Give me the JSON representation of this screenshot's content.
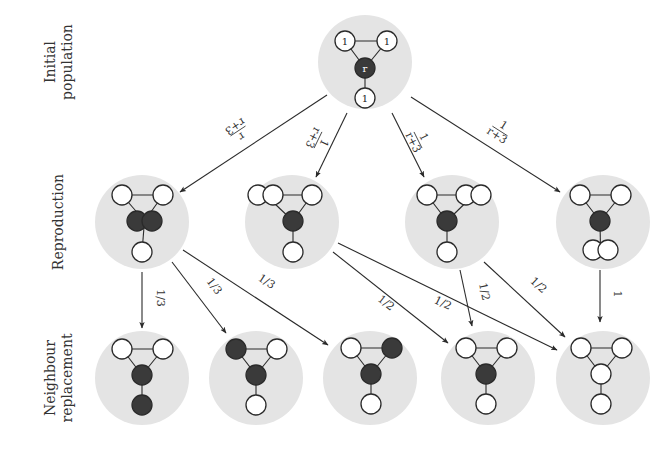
{
  "diagram": {
    "colors": {
      "halo": "#e4e4e4",
      "mutant": "#3a3a3a",
      "resident": "#ffffff",
      "stroke": "#2a2a2a",
      "text": "#333333"
    },
    "row_labels": [
      {
        "id": "initial",
        "lines": [
          "Initial",
          "population"
        ]
      },
      {
        "id": "reproduction",
        "lines": [
          "Reproduction"
        ]
      },
      {
        "id": "neighbour",
        "lines": [
          "Neighbour",
          "replacement"
        ]
      }
    ],
    "nodes": {
      "initial": {
        "x": 365,
        "y": 62,
        "circles": [
          {
            "x": 345,
            "y": 41,
            "type": "resident",
            "label": "1"
          },
          {
            "x": 387,
            "y": 41,
            "type": "resident",
            "label": "1"
          },
          {
            "x": 365,
            "y": 68,
            "type": "mutant",
            "label": "r"
          },
          {
            "x": 365,
            "y": 98,
            "type": "resident",
            "label": "1"
          }
        ]
      },
      "reproduction": [
        {
          "id": "R1",
          "x": 142,
          "y": 222,
          "circles": [
            {
              "x": 122,
              "y": 195,
              "type": "resident"
            },
            {
              "x": 163,
              "y": 195,
              "type": "resident"
            },
            {
              "x": 137,
              "y": 221,
              "type": "mutant"
            },
            {
              "x": 152,
              "y": 221,
              "type": "mutant"
            },
            {
              "x": 142,
              "y": 252,
              "type": "resident"
            }
          ]
        },
        {
          "id": "R2",
          "x": 292,
          "y": 222,
          "circles": [
            {
              "x": 258,
              "y": 195,
              "type": "resident"
            },
            {
              "x": 273,
              "y": 195,
              "type": "resident"
            },
            {
              "x": 312,
              "y": 195,
              "type": "resident"
            },
            {
              "x": 293,
              "y": 221,
              "type": "mutant"
            },
            {
              "x": 293,
              "y": 252,
              "type": "resident"
            }
          ]
        },
        {
          "id": "R3",
          "x": 452,
          "y": 222,
          "circles": [
            {
              "x": 427,
              "y": 195,
              "type": "resident"
            },
            {
              "x": 466,
              "y": 195,
              "type": "resident"
            },
            {
              "x": 481,
              "y": 195,
              "type": "resident"
            },
            {
              "x": 447,
              "y": 221,
              "type": "mutant"
            },
            {
              "x": 447,
              "y": 252,
              "type": "resident"
            }
          ]
        },
        {
          "id": "R4",
          "x": 603,
          "y": 222,
          "circles": [
            {
              "x": 580,
              "y": 195,
              "type": "resident"
            },
            {
              "x": 621,
              "y": 195,
              "type": "resident"
            },
            {
              "x": 600,
              "y": 221,
              "type": "mutant"
            },
            {
              "x": 593,
              "y": 250,
              "type": "resident"
            },
            {
              "x": 608,
              "y": 250,
              "type": "resident"
            }
          ]
        }
      ],
      "replacement": [
        {
          "id": "N1",
          "x": 142,
          "y": 378,
          "circles": [
            {
              "x": 122,
              "y": 349,
              "type": "resident"
            },
            {
              "x": 163,
              "y": 349,
              "type": "resident"
            },
            {
              "x": 142,
              "y": 375,
              "type": "mutant"
            },
            {
              "x": 142,
              "y": 405,
              "type": "mutant"
            }
          ]
        },
        {
          "id": "N2",
          "x": 256,
          "y": 378,
          "circles": [
            {
              "x": 236,
              "y": 349,
              "type": "mutant"
            },
            {
              "x": 277,
              "y": 349,
              "type": "resident"
            },
            {
              "x": 256,
              "y": 375,
              "type": "mutant"
            },
            {
              "x": 256,
              "y": 405,
              "type": "resident"
            }
          ]
        },
        {
          "id": "N3",
          "x": 370,
          "y": 378,
          "circles": [
            {
              "x": 351,
              "y": 348,
              "type": "resident"
            },
            {
              "x": 392,
              "y": 348,
              "type": "mutant"
            },
            {
              "x": 371,
              "y": 374,
              "type": "mutant"
            },
            {
              "x": 371,
              "y": 404,
              "type": "resident"
            }
          ]
        },
        {
          "id": "N4",
          "x": 488,
          "y": 378,
          "circles": [
            {
              "x": 466,
              "y": 348,
              "type": "resident"
            },
            {
              "x": 507,
              "y": 348,
              "type": "resident"
            },
            {
              "x": 486,
              "y": 374,
              "type": "mutant"
            },
            {
              "x": 486,
              "y": 404,
              "type": "resident"
            }
          ]
        },
        {
          "id": "N5",
          "x": 603,
          "y": 378,
          "circles": [
            {
              "x": 581,
              "y": 348,
              "type": "resident"
            },
            {
              "x": 622,
              "y": 348,
              "type": "resident"
            },
            {
              "x": 601,
              "y": 374,
              "type": "resident"
            },
            {
              "x": 601,
              "y": 404,
              "type": "resident"
            }
          ]
        }
      ]
    },
    "edges": [
      {
        "from": "initial",
        "to": "R1",
        "x1": 327,
        "y1": 95,
        "x2": 180,
        "y2": 192,
        "label": "r/(r+3)",
        "num": "r",
        "den": "r+3",
        "lx": 238,
        "ly": 131
      },
      {
        "from": "initial",
        "to": "R2",
        "x1": 347,
        "y1": 113,
        "x2": 316,
        "y2": 177,
        "label": "1/(r+3)",
        "num": "1",
        "den": "r+3",
        "lx": 318,
        "ly": 140
      },
      {
        "from": "initial",
        "to": "R3",
        "x1": 392,
        "y1": 113,
        "x2": 424,
        "y2": 177,
        "label": "1/(r+3)",
        "num": "1",
        "den": "r+3",
        "lx": 418,
        "ly": 140
      },
      {
        "from": "initial",
        "to": "R4",
        "x1": 411,
        "y1": 97,
        "x2": 560,
        "y2": 192,
        "label": "1/(r+3)",
        "num": "1",
        "den": "r+3",
        "lx": 500,
        "ly": 131
      },
      {
        "from": "R1",
        "to": "N1",
        "x1": 142,
        "y1": 272,
        "x2": 142,
        "y2": 328,
        "label": "1/3",
        "lx": 154,
        "ly": 298
      },
      {
        "from": "R1",
        "to": "N2",
        "x1": 172,
        "y1": 262,
        "x2": 226,
        "y2": 333,
        "label": "1/3",
        "lx": 209,
        "ly": 290
      },
      {
        "from": "R1",
        "to": "N3",
        "x1": 183,
        "y1": 250,
        "x2": 328,
        "y2": 345,
        "label": "1/3",
        "lx": 263,
        "ly": 287
      },
      {
        "from": "R2",
        "to": "N4",
        "x1": 333,
        "y1": 252,
        "x2": 448,
        "y2": 343,
        "label": "1/2",
        "lx": 382,
        "ly": 308
      },
      {
        "from": "R2",
        "to": "N5",
        "x1": 338,
        "y1": 243,
        "x2": 557,
        "y2": 350,
        "label": "1/2",
        "lx": 440,
        "ly": 309
      },
      {
        "from": "R3",
        "to": "N4",
        "x1": 460,
        "y1": 270,
        "x2": 472,
        "y2": 326,
        "label": "1/2",
        "lx": 478,
        "ly": 293
      },
      {
        "from": "R3",
        "to": "N5",
        "x1": 484,
        "y1": 262,
        "x2": 565,
        "y2": 337,
        "label": "1/2",
        "lx": 534,
        "ly": 290
      },
      {
        "from": "R4",
        "to": "N5",
        "x1": 600,
        "y1": 270,
        "x2": 600,
        "y2": 322,
        "label": "1",
        "lx": 611,
        "ly": 294
      }
    ]
  }
}
